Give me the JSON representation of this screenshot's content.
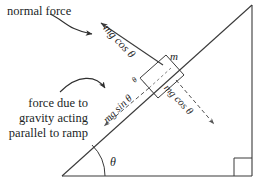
{
  "diagram": {
    "background_color": "#ffffff",
    "stroke_color": "#3a3a3a",
    "text_color": "#221f1f",
    "annotations": {
      "normal_force": "normal force",
      "gravity_parallel": "force due to gravity acting parallel to ramp",
      "normal_force_magnitude": "mg cos θ",
      "parallel_component": "mg sin θ",
      "perpendicular_component": "mg cos θ",
      "mass": "m",
      "ramp_angle": "θ",
      "component_angle": "θ"
    },
    "physics": {
      "incline_angle_symbol": "θ",
      "normal_force_expression": "mg cos θ",
      "parallel_force_expression": "mg sin θ",
      "perpendicular_force_expression": "mg cos θ",
      "mass_symbol": "m"
    },
    "geometry": {
      "triangle_vertices": "(62,176) (252,176) (252,6)",
      "right_angle_marker": "bottom-right",
      "ramp_angle_arc": "bottom-left vertex",
      "block_position": "on hypotenuse, upper-middle"
    }
  }
}
